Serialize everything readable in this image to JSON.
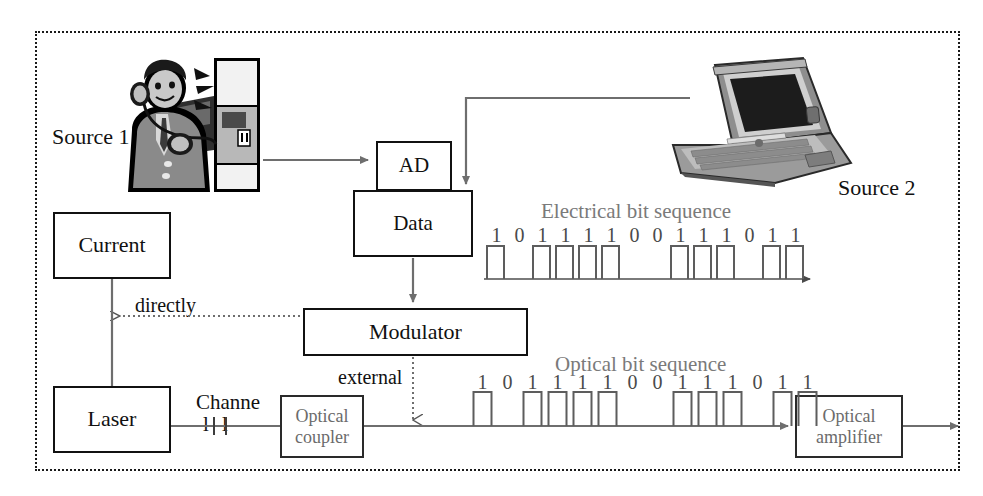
{
  "diagram": {
    "frame_style": "dotted-border"
  },
  "labels": {
    "source1": "Source 1",
    "source2": "Source 2",
    "directly": "directly",
    "external": "external",
    "channel_top": "Channe",
    "channel_bottom": "l l",
    "electrical_seq_title": "Electrical bit sequence",
    "optical_seq_title": "Optical bit sequence"
  },
  "boxes": {
    "current": "Current",
    "laser": "Laser",
    "ad": "AD",
    "data": "Data",
    "modulator": "Modulator",
    "optical_coupler_line1": "Optical",
    "optical_coupler_line2": "coupler",
    "optical_amplifier_line1": "Optical",
    "optical_amplifier_line2": "amplifier"
  },
  "chart_data": {
    "type": "line",
    "series": [
      {
        "name": "Electrical bit sequence",
        "bits": [
          "1",
          "0",
          "1",
          "1",
          "1",
          "1",
          "0",
          "0",
          "1",
          "1",
          "1",
          "0",
          "1",
          "1"
        ]
      },
      {
        "name": "Optical bit sequence",
        "bits": [
          "1",
          "0",
          "1",
          "1",
          "1",
          "1",
          "0",
          "0",
          "1",
          "1",
          "1",
          "0",
          "1",
          "1"
        ]
      }
    ]
  },
  "colors": {
    "line": "#6e6e6e",
    "box_border": "#111111",
    "gray_text": "#6b6b6b",
    "frame": "#1a1a1a",
    "pulse": "#5d5d5d"
  },
  "icons": {
    "source1": "payphone-caller-icon",
    "source2": "laptop-icon"
  }
}
